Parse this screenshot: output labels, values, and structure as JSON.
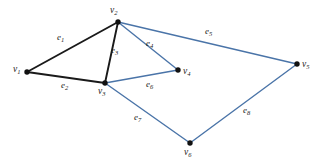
{
  "figure": {
    "type": "undirected-graph-diagram",
    "width": 317,
    "height": 167,
    "background_color": "#ffffff",
    "black_edge_color": "#1a1a1a",
    "blue_edge_color": "#4a74a8",
    "vertex_color": "#111111"
  },
  "vertices": [
    {
      "id": "v1",
      "name": "v",
      "subscript": "1",
      "x": 27,
      "y": 72,
      "label_x": 13,
      "label_y": 65
    },
    {
      "id": "v2",
      "name": "v",
      "subscript": "2",
      "x": 118,
      "y": 22,
      "label_x": 110,
      "label_y": 6
    },
    {
      "id": "v3",
      "name": "v",
      "subscript": "3",
      "x": 105,
      "y": 83,
      "label_x": 98,
      "label_y": 87
    },
    {
      "id": "v4",
      "name": "v",
      "subscript": "4",
      "x": 178,
      "y": 70,
      "label_x": 183,
      "label_y": 67
    },
    {
      "id": "v5",
      "name": "v",
      "subscript": "5",
      "x": 297,
      "y": 64,
      "label_x": 302,
      "label_y": 60
    },
    {
      "id": "v6",
      "name": "v",
      "subscript": "6",
      "x": 190,
      "y": 143,
      "label_x": 184,
      "label_y": 148
    }
  ],
  "edges": [
    {
      "id": "e1",
      "name": "e",
      "subscript": "1",
      "from": "v1",
      "to": "v2",
      "color": "#1a1a1a",
      "width": 1.9,
      "label_x": 57,
      "label_y": 33
    },
    {
      "id": "e2",
      "name": "e",
      "subscript": "2",
      "from": "v1",
      "to": "v3",
      "color": "#1a1a1a",
      "width": 1.9,
      "label_x": 61,
      "label_y": 81
    },
    {
      "id": "e3",
      "name": "e",
      "subscript": "3",
      "from": "v2",
      "to": "v3",
      "color": "#1a1a1a",
      "width": 1.9,
      "label_x": 111,
      "label_y": 46
    },
    {
      "id": "e4",
      "name": "e",
      "subscript": "4",
      "from": "v2",
      "to": "v4",
      "color": "#4a74a8",
      "width": 1.4,
      "label_x": 146,
      "label_y": 39
    },
    {
      "id": "e5",
      "name": "e",
      "subscript": "5",
      "from": "v2",
      "to": "v5",
      "color": "#4a74a8",
      "width": 1.4,
      "label_x": 205,
      "label_y": 27
    },
    {
      "id": "e6",
      "name": "e",
      "subscript": "6",
      "from": "v3",
      "to": "v4",
      "color": "#4a74a8",
      "width": 1.4,
      "label_x": 146,
      "label_y": 80
    },
    {
      "id": "e7",
      "name": "e",
      "subscript": "7",
      "from": "v3",
      "to": "v6",
      "color": "#4a74a8",
      "width": 1.4,
      "label_x": 134,
      "label_y": 113
    },
    {
      "id": "e8",
      "name": "e",
      "subscript": "8",
      "from": "v6",
      "to": "v5",
      "color": "#4a74a8",
      "width": 1.4,
      "label_x": 243,
      "label_y": 106
    }
  ]
}
